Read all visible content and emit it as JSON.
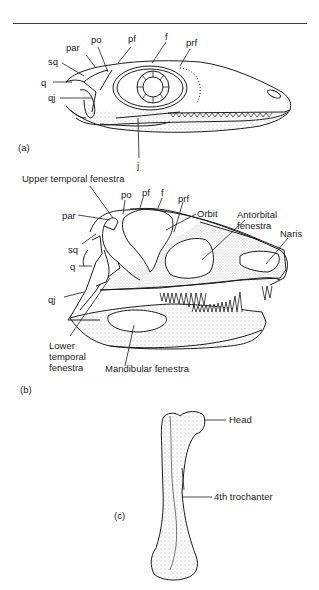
{
  "figure": {
    "panels": [
      {
        "id": "a",
        "panel_label": "(a)",
        "subject": "lizard-like skull, lateral view",
        "labels": {
          "sq": "sq",
          "par": "par",
          "po": "po",
          "pf": "pf",
          "f": "f",
          "prf": "prf",
          "q": "q",
          "qj": "qj",
          "j": "j"
        }
      },
      {
        "id": "b",
        "panel_label": "(b)",
        "subject": "archosaur skull, lateral view",
        "labels": {
          "upper_temporal_fenestra": "Upper temporal fenestra",
          "po": "po",
          "pf": "pf",
          "f": "f",
          "prf": "prf",
          "par": "par",
          "orbit": "Orbit",
          "antorbital_fenestra_1": "Antorbital",
          "antorbital_fenestra_2": "fenestra",
          "naris": "Naris",
          "sq": "sq",
          "q": "q",
          "qj": "qj",
          "lower_temporal_fenestra_1": "Lower",
          "lower_temporal_fenestra_2": "temporal",
          "lower_temporal_fenestra_3": "fenestra",
          "mandibular_fenestra": "Mandibular fenestra"
        }
      },
      {
        "id": "c",
        "panel_label": "(c)",
        "subject": "femur",
        "labels": {
          "head": "Head",
          "fourth_trochanter": "4th trochanter"
        }
      }
    ],
    "colors": {
      "ink": "#1c1c1c",
      "background": "#ffffff"
    }
  }
}
